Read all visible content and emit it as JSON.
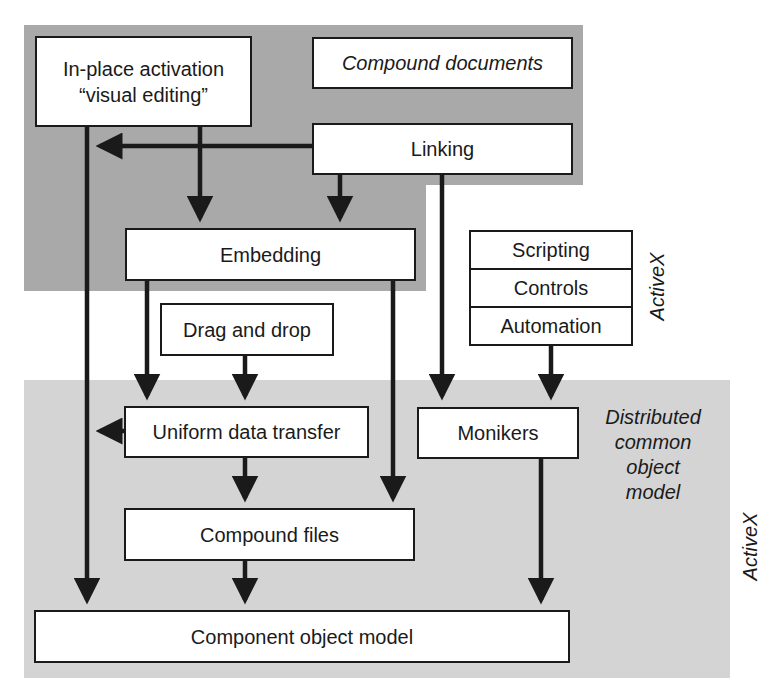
{
  "diagram": {
    "colors": {
      "top_region": "#a9a9a9",
      "bottom_region": "#d4d4d4",
      "box_fill": "#ffffff",
      "stroke": "#1a1a1a"
    },
    "regions": {
      "compound_documents": {
        "label": "Compound documents"
      },
      "distributed": {
        "label_lines": [
          "Distributed",
          "common",
          "object",
          "model"
        ]
      }
    },
    "boxes": {
      "in_place": {
        "line1": "In-place activation",
        "line2": "“visual editing”"
      },
      "compound_documents": "Compound documents",
      "linking": "Linking",
      "embedding": "Embedding",
      "drag_drop": "Drag and drop",
      "uniform_data_transfer": "Uniform data transfer",
      "compound_files": "Compound files",
      "com": "Component object model",
      "monikers": "Monikers",
      "activex_stack": [
        "Scripting",
        "Controls",
        "Automation"
      ]
    },
    "side_labels": {
      "activex_top": "ActiveX",
      "activex_bottom": "ActiveX"
    },
    "edges": [
      {
        "from": "In-place activation",
        "to": "Component object model"
      },
      {
        "from": "In-place activation",
        "to": "Embedding"
      },
      {
        "from": "Linking",
        "to": "In-place activation line"
      },
      {
        "from": "Linking",
        "to": "Embedding"
      },
      {
        "from": "Linking",
        "to": "Monikers"
      },
      {
        "from": "Embedding",
        "to": "Uniform data transfer"
      },
      {
        "from": "Embedding",
        "to": "Compound files"
      },
      {
        "from": "Drag and drop",
        "to": "Uniform data transfer"
      },
      {
        "from": "Uniform data transfer",
        "to": "In-place activation line"
      },
      {
        "from": "Uniform data transfer",
        "to": "Compound files"
      },
      {
        "from": "Compound files",
        "to": "Component object model"
      },
      {
        "from": "Automation",
        "to": "Monikers"
      },
      {
        "from": "Monikers",
        "to": "Component object model"
      }
    ]
  }
}
